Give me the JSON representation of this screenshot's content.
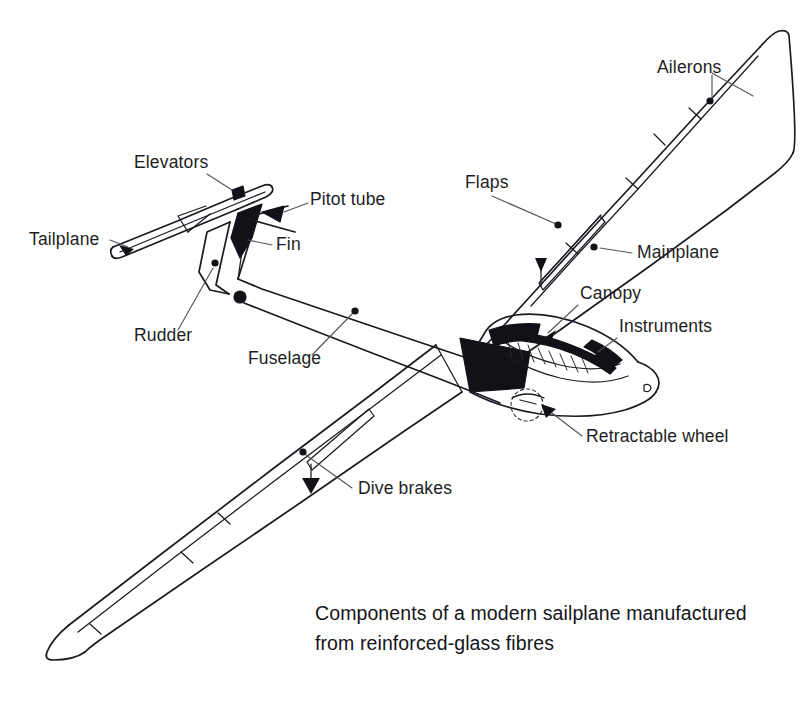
{
  "figure": {
    "title": "Components of a modern sailplane",
    "background_color": "#ffffff",
    "line_color": "#1a1a22",
    "leader_color": "#55555f"
  },
  "caption": {
    "line1": "Components of a modern sailplane manufactured",
    "line2": "from reinforced-glass fibres"
  },
  "labels": [
    {
      "id": "ailerons",
      "text": "Ailerons",
      "x": 657,
      "y": 73,
      "anchor": "start"
    },
    {
      "id": "flaps",
      "text": "Flaps",
      "x": 465,
      "y": 188,
      "anchor": "start"
    },
    {
      "id": "mainplane",
      "text": "Mainplane",
      "x": 637,
      "y": 258,
      "anchor": "start"
    },
    {
      "id": "canopy",
      "text": "Canopy",
      "x": 580,
      "y": 299,
      "anchor": "start"
    },
    {
      "id": "instruments",
      "text": "Instruments",
      "x": 619,
      "y": 332,
      "anchor": "start"
    },
    {
      "id": "retractable-wheel",
      "text": "Retractable wheel",
      "x": 586,
      "y": 442,
      "anchor": "start"
    },
    {
      "id": "elevators",
      "text": "Elevators",
      "x": 134,
      "y": 168,
      "anchor": "start"
    },
    {
      "id": "pitot-tube",
      "text": "Pitot tube",
      "x": 310,
      "y": 205,
      "anchor": "start"
    },
    {
      "id": "tailplane",
      "text": "Tailplane",
      "x": 29,
      "y": 245,
      "anchor": "start"
    },
    {
      "id": "fin",
      "text": "Fin",
      "x": 276,
      "y": 250,
      "anchor": "start"
    },
    {
      "id": "rudder",
      "text": "Rudder",
      "x": 134,
      "y": 341,
      "anchor": "start"
    },
    {
      "id": "fuselage",
      "text": "Fuselage",
      "x": 248,
      "y": 364,
      "anchor": "start"
    },
    {
      "id": "dive-brakes",
      "text": "Dive brakes",
      "x": 358,
      "y": 494,
      "anchor": "start"
    }
  ]
}
